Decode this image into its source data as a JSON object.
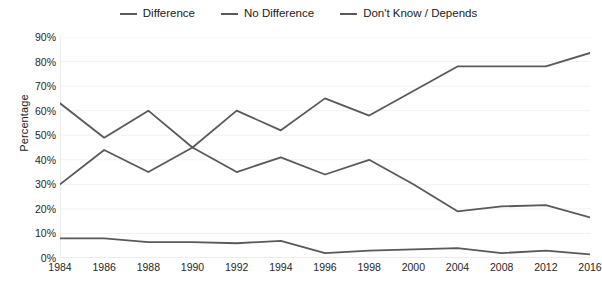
{
  "chart_data": {
    "type": "line",
    "title": "",
    "xlabel": "",
    "ylabel": "Percentage",
    "ylim": [
      0,
      90
    ],
    "ytick_step": 10,
    "ytick_labels": [
      "0%",
      "10%",
      "20%",
      "30%",
      "40%",
      "50%",
      "60%",
      "70%",
      "80%",
      "90%"
    ],
    "grid": true,
    "legend_position": "top-center",
    "categories": [
      "1984",
      "1986",
      "1988",
      "1990",
      "1992",
      "1994",
      "1996",
      "1998",
      "2000",
      "2004",
      "2008",
      "2012",
      "2016"
    ],
    "series": [
      {
        "name": "Difference",
        "color": "#595959",
        "values": [
          63,
          49,
          60,
          45,
          60,
          52,
          65,
          58,
          68,
          78,
          78,
          78,
          83.5
        ]
      },
      {
        "name": "No Difference",
        "color": "#595959",
        "values": [
          30,
          44,
          35,
          45,
          35,
          41,
          34,
          40,
          30,
          19,
          21,
          21.5,
          16.5
        ]
      },
      {
        "name": "Don't Know / Depends",
        "color": "#595959",
        "values": [
          8,
          8,
          6.5,
          6.5,
          6,
          7,
          2,
          3,
          3.5,
          4,
          2,
          3,
          1.5
        ]
      }
    ]
  },
  "style": {
    "background": "#ffffff",
    "gridline_color": "#f2f2f2",
    "axis_line_color": "#d9d9d9",
    "line_color": "#595959",
    "text_color": "#262626"
  }
}
